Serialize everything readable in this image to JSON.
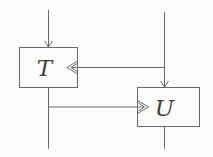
{
  "figure": {
    "type": "block-diagram",
    "background_color": "#fcfcfb"
  },
  "colors": {
    "line": "#6a6a6a",
    "text": "#3f3f3f"
  },
  "nodes": [
    {
      "id": "T",
      "label": "T"
    },
    {
      "id": "U",
      "label": "U"
    }
  ],
  "edges": [
    {
      "from": "external-top-left",
      "to": "T",
      "enters": "top",
      "arrow": "filled-v"
    },
    {
      "from": "external-top-right",
      "to": "T",
      "enters": "right-chevron-port",
      "arrow": "v-into-open-chevron"
    },
    {
      "from": "external-top-right",
      "to": "U",
      "enters": "top",
      "arrow": "filled-v"
    },
    {
      "from": "T",
      "to": "U",
      "enters": "left-chevron-port",
      "arrow": "v-into-open-chevron"
    },
    {
      "from": "T",
      "to": "external-bottom-left",
      "arrow": "none"
    },
    {
      "from": "U",
      "to": "external-bottom-right",
      "arrow": "none"
    }
  ]
}
